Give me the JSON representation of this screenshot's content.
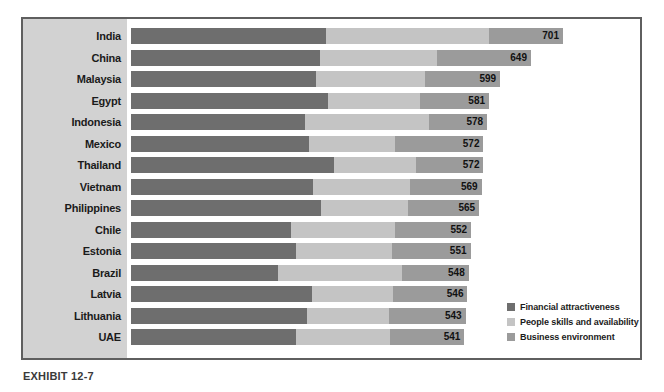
{
  "caption": "EXHIBIT 12-7",
  "colors": {
    "financial": "#6e6e6e",
    "people": "#c4c4c4",
    "business": "#9b9b9b",
    "gutter": "#d2d2d2",
    "frame": "#5f5f5f"
  },
  "legend": {
    "items": [
      {
        "label": "Financial attractiveness",
        "key": "financial"
      },
      {
        "label": "People skills and availability",
        "key": "people"
      },
      {
        "label": "Business environment",
        "key": "business"
      }
    ]
  },
  "chart_data": {
    "type": "bar",
    "orientation": "horizontal",
    "stacked": true,
    "title": "",
    "xlabel": "",
    "ylabel": "",
    "grid": false,
    "legend_position": "bottom-right",
    "xlim": [
      0,
      701
    ],
    "categories": [
      "India",
      "China",
      "Malaysia",
      "Egypt",
      "Indonesia",
      "Mexico",
      "Thailand",
      "Vietnam",
      "Philippines",
      "Chile",
      "Estonia",
      "Brazil",
      "Latvia",
      "Lithuania",
      "UAE"
    ],
    "series": [
      {
        "name": "Financial attractiveness",
        "values": [
          317,
          307,
          300,
          320,
          283,
          289,
          329,
          295,
          309,
          259,
          268,
          239,
          294,
          285,
          268
        ]
      },
      {
        "name": "People skills and availability",
        "values": [
          264,
          189,
          177,
          149,
          200,
          140,
          133,
          158,
          140,
          169,
          155,
          200,
          131,
          134,
          152
        ]
      },
      {
        "name": "Business environment",
        "values": [
          120,
          153,
          122,
          112,
          95,
          143,
          110,
          116,
          116,
          124,
          128,
          109,
          121,
          124,
          121
        ]
      }
    ],
    "totals": [
      701,
      649,
      599,
      581,
      578,
      572,
      572,
      569,
      565,
      552,
      551,
      548,
      546,
      543,
      541
    ],
    "value_labels": [
      "701",
      "649",
      "599",
      "581",
      "578",
      "572",
      "572",
      "569",
      "565",
      "552",
      "551",
      "548",
      "546",
      "543",
      "541"
    ]
  }
}
